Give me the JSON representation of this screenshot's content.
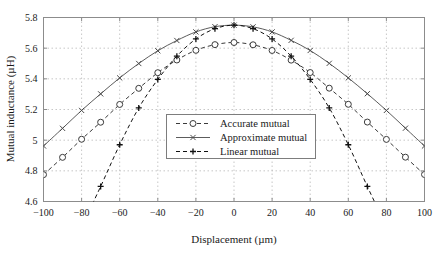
{
  "chart_data": {
    "type": "line",
    "title": "",
    "xlabel": "Displacement (µm)",
    "ylabel": "Mutual inductance (µH)",
    "xlim": [
      -100,
      100
    ],
    "ylim": [
      4.6,
      5.8
    ],
    "xticks": [
      -100,
      -80,
      -60,
      -40,
      -20,
      0,
      20,
      40,
      60,
      80,
      100
    ],
    "xticklabels": [
      "−100",
      "−80",
      "−60",
      "−40",
      "−20",
      "0",
      "20",
      "40",
      "60",
      "80",
      "100"
    ],
    "yticks": [
      4.6,
      4.8,
      5,
      5.2,
      5.4,
      5.6,
      5.8
    ],
    "yticklabels": [
      "4.6",
      "4.8",
      "5",
      "5.2",
      "5.4",
      "5.6",
      "5.8"
    ],
    "grid": true,
    "grid_style": "dotted",
    "grid_color": "#b9b9b9",
    "frame_color": "#8c8c8c",
    "background": "#ffffff",
    "legend_position": "center",
    "series": [
      {
        "name": "Accurate mutual",
        "line_style": "dashed",
        "marker": "circle",
        "color": "#3a3a3a",
        "x": [
          -100,
          -90,
          -80,
          -70,
          -60,
          -50,
          -40,
          -30,
          -20,
          -10,
          0,
          10,
          20,
          30,
          40,
          50,
          60,
          70,
          80,
          90,
          100
        ],
        "y": [
          4.775,
          4.888,
          5.006,
          5.117,
          5.233,
          5.338,
          5.44,
          5.523,
          5.586,
          5.623,
          5.637,
          5.622,
          5.585,
          5.522,
          5.441,
          5.339,
          5.234,
          5.118,
          5.005,
          4.889,
          4.776
        ]
      },
      {
        "name": "Approximate mutual",
        "line_style": "solid",
        "marker": "x",
        "color": "#4a4a4a",
        "x": [
          -100,
          -90,
          -80,
          -70,
          -60,
          -50,
          -40,
          -30,
          -20,
          -10,
          0,
          10,
          20,
          30,
          40,
          50,
          60,
          70,
          80,
          90,
          100
        ],
        "y": [
          4.962,
          5.077,
          5.194,
          5.302,
          5.406,
          5.5,
          5.583,
          5.65,
          5.706,
          5.74,
          5.75,
          5.739,
          5.706,
          5.651,
          5.585,
          5.501,
          5.406,
          5.303,
          5.194,
          5.078,
          4.962
        ]
      },
      {
        "name": "Linear mutual",
        "line_style": "dashed",
        "marker": "plus",
        "color": "#111111",
        "x": [
          -76,
          -70,
          -60,
          -50,
          -40,
          -30,
          -20,
          -10,
          0,
          10,
          20,
          30,
          40,
          50,
          60,
          70,
          76
        ],
        "y": [
          4.54,
          4.698,
          4.97,
          5.21,
          5.396,
          5.548,
          5.66,
          5.727,
          5.75,
          5.727,
          5.66,
          5.548,
          5.396,
          5.21,
          4.97,
          4.698,
          4.54
        ]
      }
    ]
  },
  "legend": {
    "items": [
      {
        "label": "Accurate mutual",
        "key": "accurate-mutual"
      },
      {
        "label": "Approximate mutual",
        "key": "approximate-mutual"
      },
      {
        "label": "Linear mutual",
        "key": "linear-mutual"
      }
    ]
  }
}
